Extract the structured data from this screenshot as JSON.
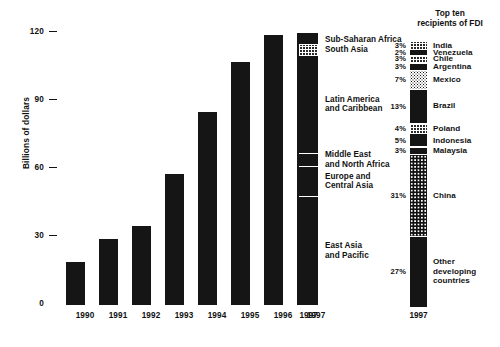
{
  "chart_data": {
    "type": "bar",
    "title": "",
    "xlabel": "",
    "ylabel": "Billions of dollars",
    "ylim": [
      0,
      120
    ],
    "yticks": [
      0,
      30,
      60,
      90,
      120
    ],
    "ytick_labels": [
      "0",
      "30",
      "60",
      "90",
      "120"
    ],
    "grid": false,
    "categories": [
      "1990",
      "1991",
      "1992",
      "1993",
      "1994",
      "1995",
      "1996",
      "1997"
    ],
    "values": [
      19,
      29,
      35,
      58,
      85,
      107,
      119,
      120
    ],
    "legend_position": "right",
    "annotations": [
      "1997 total disaggregated by region (stacked column)",
      "Top ten recipients of FDI, 1997 (stacked column)"
    ]
  },
  "axis": {
    "y_label": "Billions of dollars",
    "ticks": [
      {
        "label": "120",
        "value": 120
      },
      {
        "label": "90",
        "value": 90
      },
      {
        "label": "60",
        "value": 60
      },
      {
        "label": "30",
        "value": 30
      },
      {
        "label": "0",
        "value": 0
      }
    ]
  },
  "bars": [
    {
      "year": "1990",
      "value": 19
    },
    {
      "year": "1991",
      "value": 29
    },
    {
      "year": "1992",
      "value": 35
    },
    {
      "year": "1993",
      "value": 58
    },
    {
      "year": "1994",
      "value": 85
    },
    {
      "year": "1995",
      "value": 107
    },
    {
      "year": "1996",
      "value": 119
    },
    {
      "year": "1997",
      "value": 120
    }
  ],
  "region_stack": {
    "year": "1997",
    "total": 120,
    "segments": [
      {
        "label": "Sub-Saharan Africa",
        "value": 5,
        "pattern": "solid"
      },
      {
        "label": "South Asia",
        "value": 5,
        "pattern": "grid"
      },
      {
        "label": "Latin America\nand Caribbean",
        "value": 43,
        "pattern": "solid"
      },
      {
        "label": "Middle East\nand North Africa",
        "value": 6,
        "pattern": "solid"
      },
      {
        "label": "Europe and\nCentral Asia",
        "value": 13,
        "pattern": "solid"
      },
      {
        "label": "East Asia\nand Pacific",
        "value": 48,
        "pattern": "solid"
      }
    ]
  },
  "fdi_panel": {
    "heading": "Top ten\nrecipients of FDI",
    "year": "1997",
    "recipients": [
      {
        "percent": "3%",
        "value": 3,
        "name": "India",
        "pattern": "grid"
      },
      {
        "percent": "2%",
        "value": 2,
        "name": "Venezuela",
        "pattern": "solid"
      },
      {
        "percent": "3%",
        "value": 3,
        "name": "Chile",
        "pattern": "grid"
      },
      {
        "percent": "3%",
        "value": 3,
        "name": "Argentina",
        "pattern": "solid"
      },
      {
        "percent": "7%",
        "value": 7,
        "name": "Mexico",
        "pattern": "dots"
      },
      {
        "percent": "13%",
        "value": 13,
        "name": "Brazil",
        "pattern": "solid"
      },
      {
        "percent": "4%",
        "value": 4,
        "name": "Poland",
        "pattern": "grid"
      },
      {
        "percent": "5%",
        "value": 5,
        "name": "Indonesia",
        "pattern": "solid"
      },
      {
        "percent": "3%",
        "value": 3,
        "name": "Malaysia",
        "pattern": "solid"
      },
      {
        "percent": "31%",
        "value": 31,
        "name": "China",
        "pattern": "coarse"
      },
      {
        "percent": "27%",
        "value": 27,
        "name": "Other\ndeveloping\ncountries",
        "pattern": "solid"
      }
    ]
  },
  "colors": {
    "ink": "#151515",
    "background": "#ffffff"
  }
}
